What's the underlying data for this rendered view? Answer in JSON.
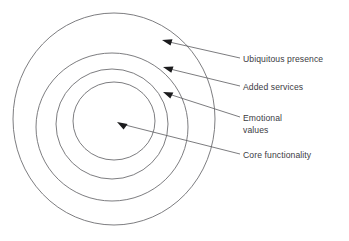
{
  "diagram": {
    "type": "concentric-circles",
    "title": "",
    "background_color": "#ffffff",
    "ring_stroke_color": "#6e6e72",
    "label_color": "#3b3b3f",
    "arrow_color": "#1b1b1d",
    "rings": [
      {
        "index": 1,
        "name": "core-functionality-ring",
        "label": "Core functionality",
        "cx": 114,
        "cy": 121,
        "rx": 41,
        "ry": 39
      },
      {
        "index": 2,
        "name": "emotional-values-ring",
        "label_line_1": "Emotional",
        "label_line_2": "values",
        "cx": 112,
        "cy": 124,
        "rx": 56,
        "ry": 55
      },
      {
        "index": 3,
        "name": "added-services-ring",
        "label": "Added services",
        "cx": 112,
        "cy": 127,
        "rx": 76,
        "ry": 74
      },
      {
        "index": 4,
        "name": "ubiquitous-presence-ring",
        "label": "Ubiquitous presence",
        "cx": 114,
        "cy": 119,
        "rx": 101,
        "ry": 106
      }
    ],
    "labels": [
      {
        "id": "ubiquitous-presence",
        "text": "Ubiquitous presence",
        "x": 243,
        "y": 54
      },
      {
        "id": "added-services",
        "text": "Added services",
        "x": 243,
        "y": 82
      },
      {
        "id": "emotional-values",
        "text": "Emotional\nvalues",
        "x": 243,
        "y": 113
      },
      {
        "id": "core-functionality",
        "text": "Core functionality",
        "x": 243,
        "y": 150
      }
    ],
    "arrows": [
      {
        "id": "arrow-ubiquitous-presence",
        "tip_x": 162,
        "tip_y": 40,
        "tail_x": 240,
        "tail_y": 58
      },
      {
        "id": "arrow-added-services",
        "tip_x": 163,
        "tip_y": 67,
        "tail_x": 240,
        "tail_y": 86
      },
      {
        "id": "arrow-emotional-values",
        "tip_x": 163,
        "tip_y": 92,
        "tail_x": 240,
        "tail_y": 117
      },
      {
        "id": "arrow-core-functionality",
        "tip_x": 117,
        "tip_y": 122,
        "tail_x": 240,
        "tail_y": 154
      }
    ]
  }
}
